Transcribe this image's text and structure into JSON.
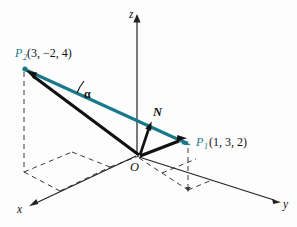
{
  "figure": {
    "kind": "3d-vector-diagram",
    "background_color": "#fdfdfd",
    "accent_color": "#17798a",
    "ink_color": "#111111"
  },
  "axes": {
    "z_label": "z",
    "x_label": "x",
    "y_label": "y"
  },
  "origin": {
    "label": "O"
  },
  "angle": {
    "label": "α"
  },
  "normal_vector": {
    "label": "N"
  },
  "points": [
    {
      "name": "P",
      "subscript": "2",
      "coords": "(3, −2, 4)",
      "full_label": "P₂(3, −2, 4)"
    },
    {
      "name": "P",
      "subscript": "1",
      "coords": "(1, 3, 2)",
      "full_label": "P₁(1, 3, 2)"
    }
  ]
}
